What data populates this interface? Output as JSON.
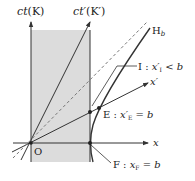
{
  "diagram": {
    "type": "minkowski-spacetime",
    "labels": {
      "ct_axis": "ct",
      "ct_axis_frame": "(K)",
      "ctp_axis": "ct′",
      "ctp_axis_frame": "(K′)",
      "x_axis": "x",
      "xp_axis": "x′",
      "hyperbola": "H",
      "hyperbola_sub": "b",
      "origin": "O",
      "point_I": "I : ",
      "point_I_var": "x′",
      "point_I_sub": "I",
      "point_I_rel": " < b",
      "point_E": "E : ",
      "point_E_var": "x′",
      "point_E_sub": "E",
      "point_E_rel": " = b",
      "point_F": "F : ",
      "point_F_var": "x",
      "point_F_sub": "F",
      "point_F_rel": " = b"
    },
    "colors": {
      "shade": "#dcdcdc",
      "line": "#333333",
      "dashed": "#777777"
    }
  }
}
